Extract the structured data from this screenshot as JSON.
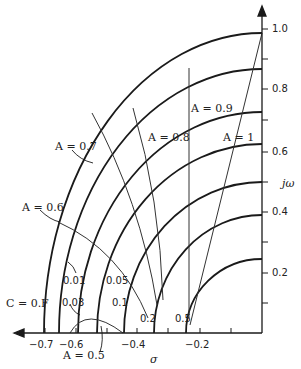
{
  "diagram": {
    "type": "s-plane contour plot",
    "axes": {
      "horizontal_label": "σ",
      "vertical_label": "jω",
      "x_ticks": [
        {
          "label": "−0.7",
          "value": -0.7
        },
        {
          "label": "−0.6",
          "value": -0.6
        },
        {
          "label": "−0.4",
          "value": -0.4
        },
        {
          "label": "−0.2",
          "value": -0.2
        }
      ],
      "y_ticks": [
        {
          "label": "0.2",
          "value": 0.2
        },
        {
          "label": "0.4",
          "value": 0.4
        },
        {
          "label": "0.6",
          "value": 0.6
        },
        {
          "label": "0.8",
          "value": 0.8
        },
        {
          "label": "1.0",
          "value": 1.0
        }
      ]
    },
    "c_curves": [
      {
        "label": "C = 0.F",
        "sigma_intercept": -0.7,
        "omega_intercept": 0.99
      },
      {
        "label": "0.01",
        "sigma_intercept": -0.65,
        "omega_intercept": 0.87
      },
      {
        "label": "0.03",
        "sigma_intercept": -0.59,
        "omega_intercept": 0.73
      },
      {
        "label": "0.05",
        "sigma_intercept": -0.53,
        "omega_intercept": 0.62
      },
      {
        "label": "0.1",
        "sigma_intercept": -0.45,
        "omega_intercept": 0.5
      },
      {
        "label": "0.2",
        "sigma_intercept": -0.35,
        "omega_intercept": 0.39
      },
      {
        "label": "0.5",
        "sigma_intercept": -0.25,
        "omega_intercept": 0.24
      }
    ],
    "a_curves": [
      {
        "label": "A = 0.5"
      },
      {
        "label": "A = 0.6"
      },
      {
        "label": "A = 0.7"
      },
      {
        "label": "A = 0.8"
      },
      {
        "label": "A = 0.9"
      },
      {
        "label": "A = 1"
      }
    ]
  }
}
